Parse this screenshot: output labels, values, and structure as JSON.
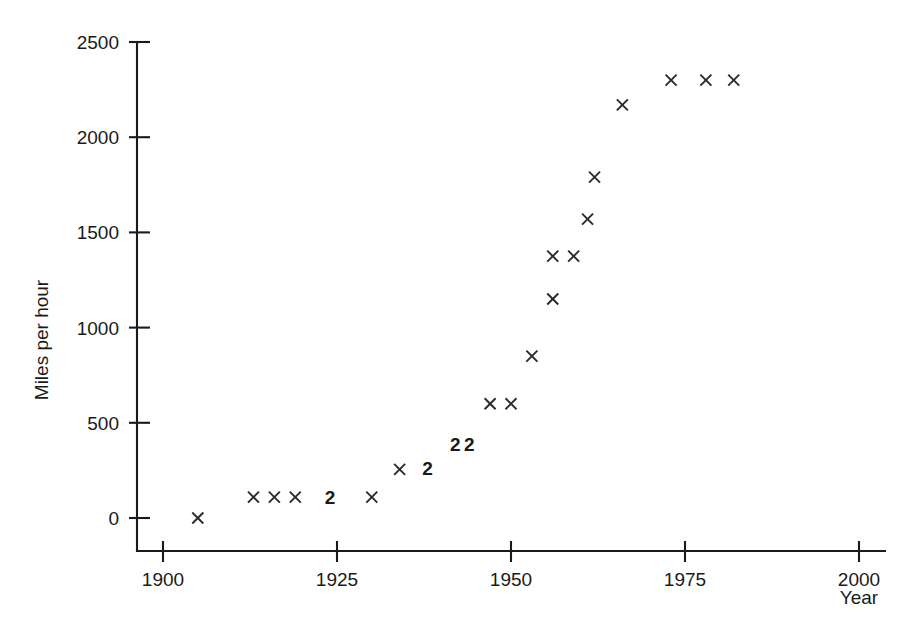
{
  "chart_data": {
    "type": "scatter",
    "title": "",
    "xlabel": "Year",
    "ylabel": "Miles per hour",
    "xlim": [
      1895,
      2003
    ],
    "ylim": [
      -130,
      2500
    ],
    "grid": false,
    "legend": null,
    "marker_symbol": "x",
    "xticks": [
      1900,
      1925,
      1950,
      1975,
      2000
    ],
    "xtick_labels": [
      "1900",
      "1925",
      "1950",
      "1975",
      "2000"
    ],
    "yticks": [
      0,
      500,
      1000,
      1500,
      2000,
      2500
    ],
    "ytick_labels": [
      "0",
      "500",
      "1000",
      "1500",
      "2000",
      "2500"
    ],
    "note": "Counts greater than 1 are drawn as a bold digit instead of an x marker.",
    "points": [
      {
        "x": 1905,
        "y": 0,
        "count": 1
      },
      {
        "x": 1913,
        "y": 110,
        "count": 1
      },
      {
        "x": 1916,
        "y": 110,
        "count": 1
      },
      {
        "x": 1919,
        "y": 110,
        "count": 1
      },
      {
        "x": 1924,
        "y": 110,
        "count": 2
      },
      {
        "x": 1930,
        "y": 110,
        "count": 1
      },
      {
        "x": 1934,
        "y": 255,
        "count": 1
      },
      {
        "x": 1938,
        "y": 260,
        "count": 2
      },
      {
        "x": 1942,
        "y": 390,
        "count": 2
      },
      {
        "x": 1944,
        "y": 390,
        "count": 2
      },
      {
        "x": 1947,
        "y": 600,
        "count": 1
      },
      {
        "x": 1950,
        "y": 600,
        "count": 1
      },
      {
        "x": 1953,
        "y": 850,
        "count": 1
      },
      {
        "x": 1956,
        "y": 1150,
        "count": 1
      },
      {
        "x": 1956,
        "y": 1375,
        "count": 1
      },
      {
        "x": 1959,
        "y": 1375,
        "count": 1
      },
      {
        "x": 1961,
        "y": 1570,
        "count": 1
      },
      {
        "x": 1962,
        "y": 1790,
        "count": 1
      },
      {
        "x": 1966,
        "y": 2170,
        "count": 1
      },
      {
        "x": 1973,
        "y": 2300,
        "count": 1
      },
      {
        "x": 1978,
        "y": 2300,
        "count": 1
      },
      {
        "x": 1982,
        "y": 2300,
        "count": 1
      }
    ]
  },
  "axes": {
    "y_title": "Miles per hour",
    "x_title": "Year"
  }
}
